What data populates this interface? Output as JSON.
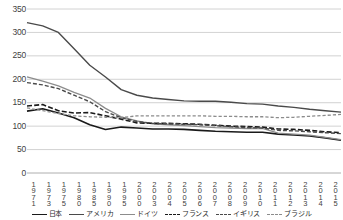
{
  "chart_data": {
    "type": "line",
    "title": "",
    "subtitle": "",
    "xlabel": "",
    "ylabel": "",
    "ylim": [
      0,
      350
    ],
    "ytick_step": 50,
    "yticks": [
      0,
      50,
      100,
      150,
      200,
      250,
      300,
      350
    ],
    "grid": true,
    "legend_position": "bottom",
    "categories": [
      "1971",
      "1973",
      "1975",
      "1980",
      "1985",
      "1990",
      "1995",
      "2000",
      "2003",
      "2004",
      "2005",
      "2006",
      "2007",
      "2008",
      "2009",
      "2010",
      "2011",
      "2012",
      "2013",
      "2014",
      "2015"
    ],
    "series": [
      {
        "name": "日本",
        "style": "solid",
        "color": "#1a1a1a",
        "width": 1.6,
        "values": [
          132,
          137,
          128,
          118,
          103,
          93,
          98,
          96,
          94,
          94,
          93,
          91,
          89,
          88,
          87,
          87,
          83,
          81,
          79,
          75,
          70
        ]
      },
      {
        "name": "アメリカ",
        "style": "solid",
        "color": "#4a4a4a",
        "width": 1.4,
        "values": [
          321,
          314,
          300,
          265,
          230,
          205,
          178,
          166,
          160,
          157,
          154,
          153,
          153,
          151,
          148,
          147,
          143,
          140,
          136,
          133,
          130
        ]
      },
      {
        "name": "ドイツ",
        "style": "solid",
        "color": "#8c8c8c",
        "width": 1.3,
        "values": [
          205,
          196,
          186,
          172,
          160,
          138,
          120,
          111,
          105,
          103,
          101,
          99,
          97,
          96,
          95,
          95,
          85,
          83,
          81,
          76,
          71
        ]
      },
      {
        "name": "フランス",
        "style": "dashed-long",
        "color": "#1a1a1a",
        "width": 1.6,
        "values": [
          143,
          146,
          133,
          128,
          129,
          122,
          115,
          107,
          106,
          106,
          105,
          104,
          102,
          100,
          99,
          98,
          94,
          93,
          91,
          88,
          86
        ]
      },
      {
        "name": "イギリス",
        "style": "dashed-med",
        "color": "#4a4a4a",
        "width": 1.4,
        "values": [
          193,
          188,
          180,
          166,
          152,
          131,
          118,
          110,
          106,
          105,
          104,
          103,
          101,
          99,
          97,
          96,
          91,
          90,
          88,
          86,
          84
        ]
      },
      {
        "name": "ブラジル",
        "style": "dashed-short",
        "color": "#8c8c8c",
        "width": 1.3,
        "values": [
          139,
          133,
          127,
          122,
          120,
          119,
          118,
          122,
          122,
          122,
          122,
          122,
          121,
          121,
          120,
          120,
          118,
          119,
          121,
          123,
          125
        ]
      }
    ]
  },
  "axis": {
    "y_labels": [
      "350",
      "300",
      "250",
      "200",
      "150",
      "100",
      "50",
      "0"
    ]
  },
  "legend": {
    "items": [
      {
        "label": "日本",
        "style": "solid",
        "color": "#1a1a1a"
      },
      {
        "label": "アメリカ",
        "style": "solid",
        "color": "#4a4a4a"
      },
      {
        "label": "ドイツ",
        "style": "solid",
        "color": "#8c8c8c"
      },
      {
        "label": "フランス",
        "style": "dashed-long",
        "color": "#1a1a1a"
      },
      {
        "label": "イギリス",
        "style": "dashed-med",
        "color": "#4a4a4a"
      },
      {
        "label": "ブラジル",
        "style": "dashed-short",
        "color": "#8c8c8c"
      }
    ]
  }
}
